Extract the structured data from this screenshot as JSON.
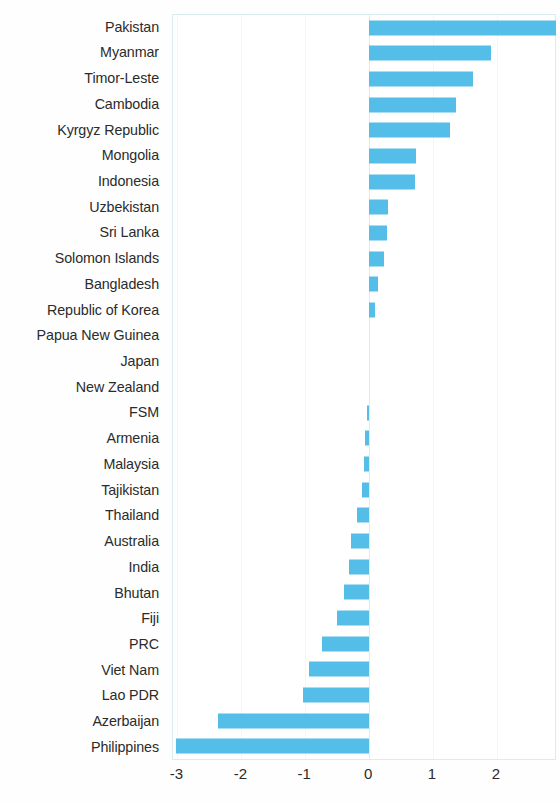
{
  "chart_data": {
    "type": "bar",
    "orientation": "horizontal",
    "title": "",
    "subtitle": "",
    "xlabel": "",
    "ylabel": "",
    "xlim": [
      -3.07,
      2.94
    ],
    "xticks": [
      -3,
      -2,
      -1,
      0,
      1,
      2
    ],
    "xtick_labels": [
      "-3",
      "-2",
      "-1",
      "0",
      "1",
      "2"
    ],
    "grid": true,
    "legend": false,
    "bar_color": "#54bde8",
    "zero_line_color": "#d6eef6",
    "categories": [
      "Pakistan",
      "Myanmar",
      "Timor-Leste",
      "Cambodia",
      "Kyrgyz Republic",
      "Mongolia",
      "Indonesia",
      "Uzbekistan",
      "Sri Lanka",
      "Solomon Islands",
      "Bangladesh",
      "Republic of Korea",
      "Papua New Guinea",
      "Japan",
      "New Zealand",
      "FSM",
      "Armenia",
      "Malaysia",
      "Tajikistan",
      "Thailand",
      "Australia",
      "India",
      "Bhutan",
      "Fiji",
      "PRC",
      "Viet Nam",
      "Lao PDR",
      "Azerbaijan",
      "Philippines"
    ],
    "values": [
      2.93,
      1.9,
      1.63,
      1.36,
      1.27,
      0.74,
      0.71,
      0.29,
      0.28,
      0.23,
      0.14,
      0.09,
      0.0,
      0.0,
      0.0,
      -0.04,
      -0.06,
      -0.08,
      -0.11,
      -0.19,
      -0.29,
      -0.32,
      -0.39,
      -0.51,
      -0.74,
      -0.94,
      -1.04,
      -2.36,
      -3.02
    ]
  }
}
